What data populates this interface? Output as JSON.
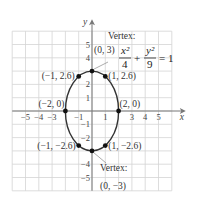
{
  "chart_data": {
    "type": "line",
    "title": "",
    "equation": {
      "term1_num": "x²",
      "term1_den": "4",
      "plus": "+",
      "term2_num": "y²",
      "term2_den": "9",
      "rhs": "= 1"
    },
    "xlabel": "x",
    "ylabel": "y",
    "xlim": [
      -6,
      6
    ],
    "ylim": [
      -6,
      6
    ],
    "grid": true,
    "x_ticks": [
      -5,
      -4,
      -3,
      -1,
      1,
      3,
      4,
      5
    ],
    "x_tick_labels": [
      "−5",
      "−4",
      "−3",
      "−1",
      "1",
      "3",
      "4",
      "5"
    ],
    "y_ticks": [
      5,
      4,
      2,
      1,
      -1,
      -2,
      -4,
      -5
    ],
    "y_tick_labels": [
      "5",
      "4",
      "2",
      "1",
      "−1",
      "−2",
      "−4",
      "−5"
    ],
    "ellipse": {
      "a": 2,
      "b": 3,
      "center": [
        0,
        0
      ]
    },
    "points": [
      {
        "x": 0,
        "y": 3,
        "label": "(0, 3)",
        "vertex": true
      },
      {
        "x": -1,
        "y": 2.6,
        "label": "(−1, 2.6)"
      },
      {
        "x": 1,
        "y": 2.6,
        "label": "(1, 2.6)"
      },
      {
        "x": -2,
        "y": 0,
        "label": "(−2, 0)"
      },
      {
        "x": 2,
        "y": 0,
        "label": "(2, 0)"
      },
      {
        "x": -1,
        "y": -2.6,
        "label": "(−1, −2.6)"
      },
      {
        "x": 1,
        "y": -2.6,
        "label": "(1, −2.6)"
      },
      {
        "x": 0,
        "y": -3,
        "label": "(0, −3)",
        "vertex": true
      }
    ],
    "annotations": [
      {
        "text": "Vertex:",
        "for": "(0, 3)"
      },
      {
        "text": "Vertex:",
        "for": "(0, −3)"
      }
    ]
  }
}
